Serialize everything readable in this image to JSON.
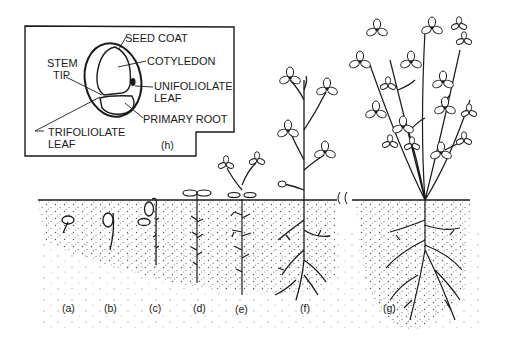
{
  "diagram": {
    "type": "botanical illustration — seedling growth stages",
    "inset": {
      "id": "(h)",
      "labels": {
        "seed_coat": "SEED COAT",
        "cotyledon": "COTYLEDON",
        "stem_tip_1": "STEM",
        "stem_tip_2": "TIP",
        "unifoliolate_1": "UNIFOLIOLATE",
        "unifoliolate_2": "LEAF",
        "primary_root": "PRIMARY ROOT",
        "trifoliolate_1": "TRIFOLIOLATE",
        "trifoliolate_2": "LEAF"
      }
    },
    "stages": [
      {
        "id": "a",
        "label": "(a)"
      },
      {
        "id": "b",
        "label": "(b)"
      },
      {
        "id": "c",
        "label": "(c)"
      },
      {
        "id": "d",
        "label": "(d)"
      },
      {
        "id": "e",
        "label": "(e)"
      },
      {
        "id": "f",
        "label": "(f)"
      },
      {
        "id": "g",
        "label": "(g)"
      }
    ],
    "colors": {
      "ink": "#1a1a1a",
      "background": "#ffffff"
    }
  }
}
